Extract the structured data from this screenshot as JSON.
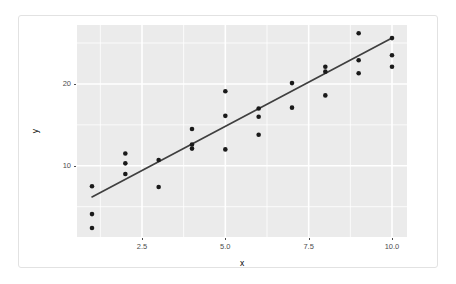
{
  "chart_data": {
    "type": "scatter",
    "title": "",
    "xlabel": "x",
    "ylabel": "y",
    "grid": true,
    "legend": null,
    "xlim": [
      0.55,
      10.45
    ],
    "ylim": [
      1.3,
      27.2
    ],
    "xticks": [
      2.5,
      5.0,
      7.5,
      10.0
    ],
    "xtick_labels": [
      "2.5",
      "5.0",
      "7.5",
      "10.0"
    ],
    "yticks": [
      10,
      20
    ],
    "ytick_labels": [
      "10",
      "20"
    ],
    "points": [
      {
        "x": 1,
        "y": 7.5
      },
      {
        "x": 1,
        "y": 4.1
      },
      {
        "x": 1,
        "y": 2.4
      },
      {
        "x": 2,
        "y": 11.5
      },
      {
        "x": 2,
        "y": 10.3
      },
      {
        "x": 2,
        "y": 9.0
      },
      {
        "x": 3,
        "y": 10.7
      },
      {
        "x": 3,
        "y": 7.4
      },
      {
        "x": 4,
        "y": 14.5
      },
      {
        "x": 4,
        "y": 12.6
      },
      {
        "x": 4,
        "y": 12.1
      },
      {
        "x": 5,
        "y": 19.1
      },
      {
        "x": 5,
        "y": 16.1
      },
      {
        "x": 5,
        "y": 12.0
      },
      {
        "x": 6,
        "y": 17.0
      },
      {
        "x": 6,
        "y": 16.0
      },
      {
        "x": 6,
        "y": 13.8
      },
      {
        "x": 7,
        "y": 20.1
      },
      {
        "x": 7,
        "y": 17.1
      },
      {
        "x": 8,
        "y": 22.1
      },
      {
        "x": 8,
        "y": 21.5
      },
      {
        "x": 8,
        "y": 18.6
      },
      {
        "x": 9,
        "y": 26.2
      },
      {
        "x": 9,
        "y": 22.9
      },
      {
        "x": 9,
        "y": 21.3
      },
      {
        "x": 10,
        "y": 25.6
      },
      {
        "x": 10,
        "y": 23.5
      },
      {
        "x": 10,
        "y": 22.1
      }
    ],
    "fit_line": {
      "kind": "linear-regression",
      "x0": 1.0,
      "y0": 6.2,
      "x1": 10.0,
      "y1": 25.6
    },
    "colors": {
      "panel_background": "#ebebeb",
      "gridline": "#ffffff",
      "point": "#1a1a1a",
      "fit_line": "#3f3f3f",
      "axis_text": "#4d4d4d",
      "axis_title": "#000000",
      "card_border": "#e2e2e2",
      "page_background": "#ffffff"
    }
  }
}
